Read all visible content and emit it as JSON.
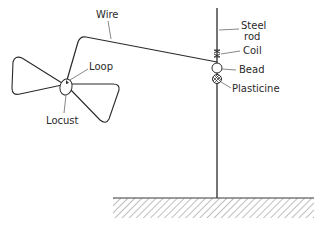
{
  "diagram": {
    "type": "apparatus-sketch",
    "colors": {
      "ink": "#2a2a2a",
      "hatch": "#7a7a7a",
      "background": "#ffffff"
    },
    "labels": {
      "wire": "Wire",
      "steel_rod_line1": "Steel",
      "steel_rod_line2": "rod",
      "coil": "Coil",
      "bead": "Bead",
      "plasticine": "Plasticine",
      "loop": "Loop",
      "locust": "Locust"
    },
    "components": [
      {
        "id": "steel-rod",
        "label": "Steel rod"
      },
      {
        "id": "wire",
        "label": "Wire"
      },
      {
        "id": "coil",
        "label": "Coil"
      },
      {
        "id": "bead",
        "label": "Bead"
      },
      {
        "id": "plasticine",
        "label": "Plasticine"
      },
      {
        "id": "loop",
        "label": "Loop"
      },
      {
        "id": "locust",
        "label": "Locust"
      },
      {
        "id": "ground-base",
        "label": ""
      }
    ]
  }
}
